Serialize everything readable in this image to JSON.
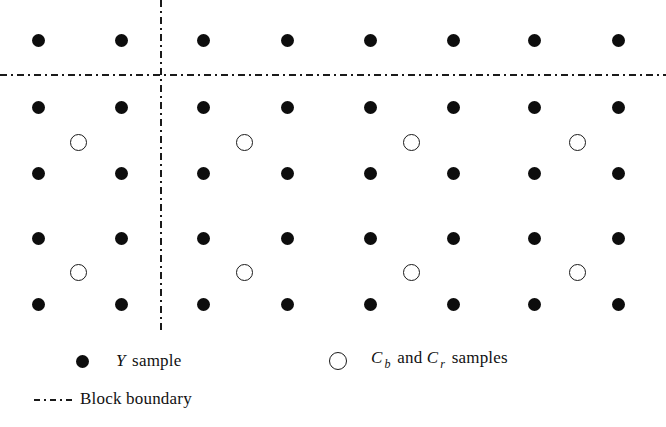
{
  "figure": {
    "canvas": {
      "width": 666,
      "height": 427
    }
  },
  "grid": {
    "y_sample_columns_x": [
      38,
      121,
      203,
      287,
      370,
      453,
      534,
      618
    ],
    "y_sample_rows_y": [
      40,
      107,
      173,
      238,
      304
    ],
    "chroma_columns_x": [
      78,
      244,
      411,
      577
    ],
    "chroma_rows_y": [
      142,
      272
    ],
    "block_boundary_vertical_x": [
      161
    ],
    "block_boundary_horizontal_y": [
      75
    ],
    "counts": {
      "y_samples": 40,
      "chroma_samples": 8,
      "boundary_lines": 2
    },
    "colors": {
      "y_sample_fill": "#0d0d0d",
      "chroma_stroke": "#1a1a1a",
      "boundary_stroke": "#1a1a1a",
      "background": "#ffffff"
    }
  },
  "legend": {
    "items": [
      {
        "mark": "filled-dot",
        "symbol": "Y",
        "subscript": "",
        "text": " sample",
        "full_label": "Y sample"
      },
      {
        "mark": "open-circle",
        "symbol": "C",
        "subscript": "b",
        "text": " and ",
        "symbol2": "C",
        "subscript2": "r",
        "text2": " samples",
        "full_label": "Cb and Cr samples"
      },
      {
        "mark": "dash-dot-line",
        "symbol": "",
        "subscript": "",
        "text": "Block boundary",
        "full_label": "Block boundary"
      }
    ]
  },
  "chart_data": {
    "type": "scatter",
    "title": "",
    "xlabel": "",
    "ylabel": "",
    "grid": false,
    "legend_position": "bottom",
    "series": [
      {
        "name": "Y sample",
        "marker": "filled-circle",
        "color": "#0d0d0d",
        "x": [
          38,
          121,
          203,
          287,
          370,
          453,
          534,
          618,
          38,
          121,
          203,
          287,
          370,
          453,
          534,
          618,
          38,
          121,
          203,
          287,
          370,
          453,
          534,
          618,
          38,
          121,
          203,
          287,
          370,
          453,
          534,
          618,
          38,
          121,
          203,
          287,
          370,
          453,
          534,
          618
        ],
        "y": [
          40,
          40,
          40,
          40,
          40,
          40,
          40,
          40,
          107,
          107,
          107,
          107,
          107,
          107,
          107,
          107,
          173,
          173,
          173,
          173,
          173,
          173,
          173,
          173,
          238,
          238,
          238,
          238,
          238,
          238,
          238,
          238,
          304,
          304,
          304,
          304,
          304,
          304,
          304,
          304
        ]
      },
      {
        "name": "Cb and Cr samples",
        "marker": "open-circle",
        "color": "#1a1a1a",
        "x": [
          78,
          244,
          411,
          577,
          78,
          244,
          411,
          577
        ],
        "y": [
          142,
          142,
          142,
          142,
          272,
          272,
          272,
          272
        ]
      }
    ],
    "annotations": [
      {
        "type": "vline",
        "x": 161,
        "style": "dash-dot",
        "label": "Block boundary"
      },
      {
        "type": "hline",
        "y": 75,
        "style": "dash-dot",
        "label": "Block boundary"
      }
    ]
  }
}
